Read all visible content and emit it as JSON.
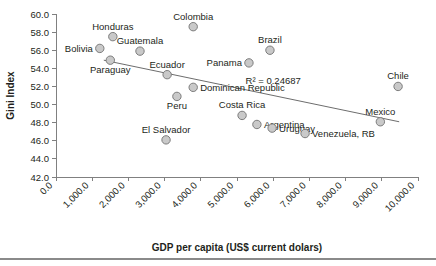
{
  "chart_data": {
    "type": "scatter",
    "title": "",
    "xlabel": "GDP per capita (US$ current dolars)",
    "ylabel": "Gini Index",
    "xlim": [
      0,
      10000
    ],
    "ylim": [
      42.0,
      60.0
    ],
    "grid": false,
    "legend": null,
    "xticks": [
      "0.0",
      "1,000.0",
      "2,000.0",
      "3,000.0",
      "4,000.0",
      "5,000.0",
      "6,000.0",
      "7,000.0",
      "8,000.0",
      "9,000.0",
      "10,000.0"
    ],
    "yticks": [
      "42.0",
      "44.0",
      "46.0",
      "48.0",
      "50.0",
      "52.0",
      "54.0",
      "56.0",
      "58.0",
      "60.0"
    ],
    "annotations": [
      {
        "text": "R² = 0.24687",
        "x": 6000,
        "y": 52.3
      }
    ],
    "trendline": {
      "type": "linear",
      "x_start": 1320,
      "y_start": 54.9,
      "x_end": 9480,
      "y_end": 48.1,
      "r_squared": 0.24687
    },
    "points": [
      {
        "name": "Bolivia",
        "x": 1210,
        "y": 56.2,
        "label_pos": "left"
      },
      {
        "name": "Honduras",
        "x": 1570,
        "y": 57.5,
        "label_pos": "top"
      },
      {
        "name": "Guatemala",
        "x": 2320,
        "y": 55.9,
        "label_pos": "top"
      },
      {
        "name": "Paraguay",
        "x": 1500,
        "y": 54.9,
        "label_pos": "bottom"
      },
      {
        "name": "Colombia",
        "x": 3790,
        "y": 58.6,
        "label_pos": "top"
      },
      {
        "name": "Ecuador",
        "x": 3070,
        "y": 53.3,
        "label_pos": "top"
      },
      {
        "name": "Dominican Republic",
        "x": 3790,
        "y": 51.9,
        "label_pos": "right"
      },
      {
        "name": "Peru",
        "x": 3340,
        "y": 50.9,
        "label_pos": "bottom"
      },
      {
        "name": "El Salvador",
        "x": 3040,
        "y": 46.1,
        "label_pos": "top"
      },
      {
        "name": "Panama",
        "x": 5330,
        "y": 54.6,
        "label_pos": "left"
      },
      {
        "name": "Brazil",
        "x": 5910,
        "y": 56.0,
        "label_pos": "top"
      },
      {
        "name": "Costa Rica",
        "x": 5140,
        "y": 48.8,
        "label_pos": "top"
      },
      {
        "name": "Argentina",
        "x": 5550,
        "y": 47.8,
        "label_pos": "right"
      },
      {
        "name": "Uruguay",
        "x": 5970,
        "y": 47.4,
        "label_pos": "right"
      },
      {
        "name": "Venezuela, RB",
        "x": 6880,
        "y": 46.8,
        "label_pos": "right"
      },
      {
        "name": "Chile",
        "x": 9450,
        "y": 52.0,
        "label_pos": "top"
      },
      {
        "name": "Mexico",
        "x": 8960,
        "y": 48.1,
        "label_pos": "top"
      }
    ]
  }
}
